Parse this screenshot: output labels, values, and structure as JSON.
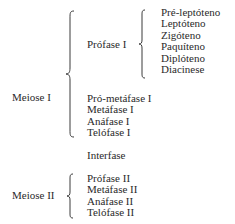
{
  "meiose1": {
    "label": "Meiose I",
    "profase": {
      "label": "Prófase I",
      "subphases": [
        "Pré-leptóteno",
        "Leptóteno",
        "Zigóteno",
        "Paquíteno",
        "Diplóteno",
        "Diacinese"
      ]
    },
    "phases": [
      "Pró-metáfase I",
      "Metáfase I",
      "Anáfase I",
      "Telófase I"
    ]
  },
  "interfase": "Interfase",
  "meiose2": {
    "label": "Meiose II",
    "phases": [
      "Prófase II",
      "Metáfase II",
      "Anáfase II",
      "Telófase II"
    ]
  }
}
